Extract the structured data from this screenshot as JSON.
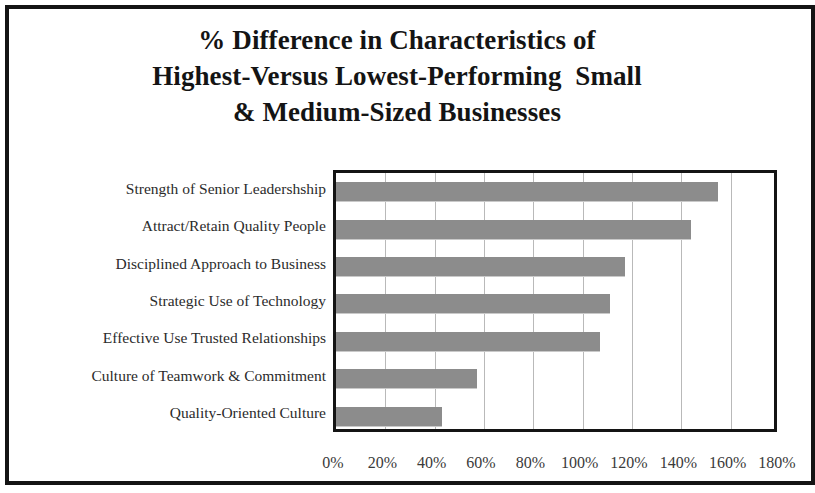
{
  "figure": {
    "title_lines": [
      "% Difference in Characteristics of",
      "Highest-Versus Lowest-Performing  Small",
      "& Medium-Sized Businesses"
    ],
    "bar_color": "#8c8c8c",
    "frame_color": "#141414",
    "gridline_color": "#b9b9b9",
    "label_color": "#2b2b2b"
  },
  "chart_data": {
    "type": "bar",
    "orientation": "horizontal",
    "title": "% Difference in Characteristics of Highest-Versus Lowest-Performing  Small & Medium-Sized Businesses",
    "subtitle": "",
    "xlabel": "",
    "ylabel": "",
    "categories": [
      "Strength of Senior Leadershship",
      "Attract/Retain Quality People",
      "Disciplined Approach to Business",
      "Strategic Use of Technology",
      "Effective Use Trusted Relationships",
      "Culture of Teamwork & Commitment",
      "Quality-Oriented Culture"
    ],
    "values": [
      155,
      144,
      117,
      111,
      107,
      57,
      43
    ],
    "value_unit": "%",
    "xlim": [
      0,
      180
    ],
    "xticks": [
      0,
      20,
      40,
      60,
      80,
      100,
      120,
      140,
      160,
      180
    ],
    "xtick_labels": [
      "0%",
      "20%",
      "40%",
      "60%",
      "80%",
      "100%",
      "120%",
      "140%",
      "160%",
      "180%"
    ],
    "grid": true,
    "grid_axis": "x",
    "legend": false,
    "legend_position": "none",
    "series": [
      {
        "name": "% Difference",
        "values": [
          155,
          144,
          117,
          111,
          107,
          57,
          43
        ]
      }
    ]
  }
}
